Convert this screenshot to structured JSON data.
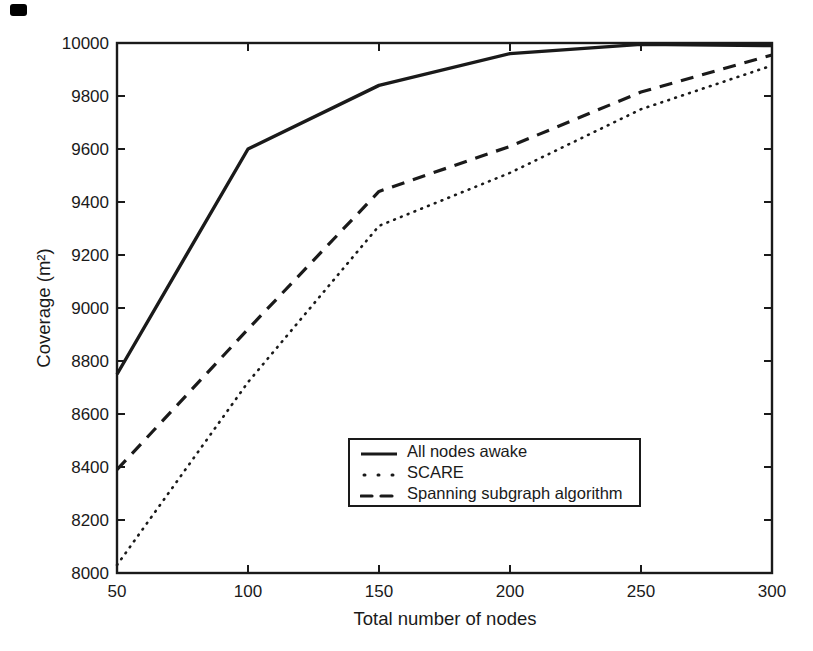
{
  "figure": {
    "background": "#ffffff",
    "ink_color": "#1a1a1a"
  },
  "chart_data": {
    "type": "line",
    "title": "",
    "xlabel": "Total number of nodes",
    "ylabel": "Coverage (m²)",
    "xlim": [
      50,
      300
    ],
    "ylim": [
      8000,
      10000
    ],
    "xticks": [
      50,
      100,
      150,
      200,
      250,
      300
    ],
    "yticks": [
      8000,
      8200,
      8400,
      8600,
      8800,
      9000,
      9200,
      9400,
      9600,
      9800,
      10000
    ],
    "grid": false,
    "legend_position": "inside-lower-center",
    "x": [
      50,
      100,
      150,
      200,
      250,
      300
    ],
    "series": [
      {
        "name": "All nodes awake",
        "style": "solid",
        "values": [
          8750,
          9600,
          9840,
          9960,
          9995,
          9990
        ]
      },
      {
        "name": "SCARE",
        "style": "dotted",
        "values": [
          8030,
          8720,
          9310,
          9510,
          9750,
          9915
        ]
      },
      {
        "name": "Spanning subgraph algorithm",
        "style": "dashed",
        "values": [
          8390,
          8920,
          9440,
          9610,
          9815,
          9955
        ]
      }
    ]
  }
}
